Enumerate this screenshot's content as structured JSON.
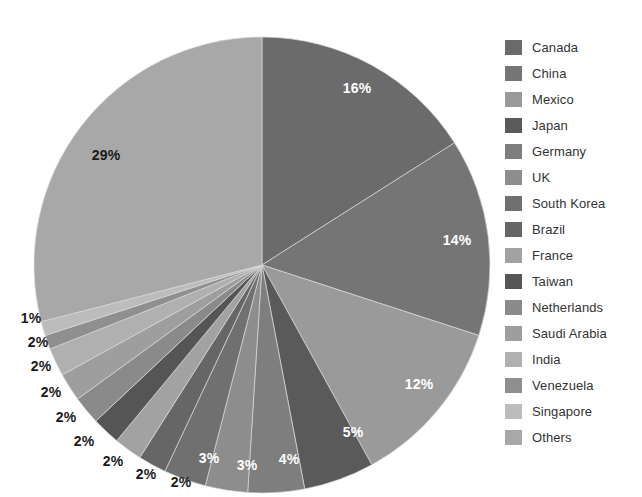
{
  "chart_data": {
    "type": "pie",
    "title": "",
    "subtitle": "",
    "xlabel": "",
    "ylabel": "",
    "grid": false,
    "legend_position": "right",
    "label_format": "percent",
    "start_angle_deg": 0,
    "direction": "clockwise",
    "categories": [
      "Canada",
      "China",
      "Mexico",
      "Japan",
      "Germany",
      "UK",
      "South Korea",
      "Brazil",
      "France",
      "Taiwan",
      "Netherlands",
      "Saudi Arabia",
      "India",
      "Venezuela",
      "Singapore",
      "Others"
    ],
    "values": [
      16,
      14,
      12,
      5,
      4,
      3,
      3,
      2,
      2,
      2,
      2,
      2,
      2,
      1,
      1,
      29
    ],
    "data_labels": [
      "16%",
      "14%",
      "12%",
      "5%",
      "4%",
      "3%",
      "3%",
      "2%",
      "2%",
      "2%",
      "2%",
      "2%",
      "2%",
      "1%",
      "1%",
      "29%"
    ],
    "colors": [
      "#6b6b6b",
      "#757575",
      "#9a9a9a",
      "#5a5a5a",
      "#7e7e7e",
      "#8d8d8d",
      "#707070",
      "#666666",
      "#a2a2a2",
      "#555555",
      "#8a8a8a",
      "#9e9e9e",
      "#b0b0b0",
      "#8f8f8f",
      "#bcbcbc",
      "#a8a8a8"
    ],
    "slice_label_positions": [
      {
        "label": "16%",
        "x": 357,
        "y": 88,
        "placement": "inside"
      },
      {
        "label": "14%",
        "x": 457,
        "y": 240,
        "placement": "inside"
      },
      {
        "label": "12%",
        "x": 419,
        "y": 384,
        "placement": "inside"
      },
      {
        "label": "5%",
        "x": 353,
        "y": 432,
        "placement": "inside"
      },
      {
        "label": "4%",
        "x": 289,
        "y": 459,
        "placement": "inside"
      },
      {
        "label": "3%",
        "x": 247,
        "y": 465,
        "placement": "inside"
      },
      {
        "label": "3%",
        "x": 209,
        "y": 458,
        "placement": "inside"
      },
      {
        "label": "2%",
        "x": 181,
        "y": 482,
        "placement": "outside"
      },
      {
        "label": "2%",
        "x": 146,
        "y": 474,
        "placement": "outside"
      },
      {
        "label": "2%",
        "x": 113,
        "y": 461,
        "placement": "outside"
      },
      {
        "label": "2%",
        "x": 84,
        "y": 441,
        "placement": "outside"
      },
      {
        "label": "2%",
        "x": 66,
        "y": 417,
        "placement": "outside"
      },
      {
        "label": "2%",
        "x": 51,
        "y": 392,
        "placement": "outside"
      },
      {
        "label": "2%",
        "x": 41,
        "y": 366,
        "placement": "outside"
      },
      {
        "label": "2%",
        "x": 38,
        "y": 342,
        "placement": "outside"
      },
      {
        "label": "1%",
        "x": 31,
        "y": 318,
        "placement": "outside"
      },
      {
        "label": "29%",
        "x": 106,
        "y": 155,
        "placement": "outside"
      }
    ],
    "geometry": {
      "center_x": 262,
      "center_y": 265,
      "radius": 228
    }
  },
  "legend": {
    "items": [
      {
        "label": "Canada",
        "color": "#6b6b6b"
      },
      {
        "label": "China",
        "color": "#757575"
      },
      {
        "label": "Mexico",
        "color": "#9a9a9a"
      },
      {
        "label": "Japan",
        "color": "#5a5a5a"
      },
      {
        "label": "Germany",
        "color": "#7e7e7e"
      },
      {
        "label": "UK",
        "color": "#8d8d8d"
      },
      {
        "label": "South Korea",
        "color": "#707070"
      },
      {
        "label": "Brazil",
        "color": "#666666"
      },
      {
        "label": "France",
        "color": "#a2a2a2"
      },
      {
        "label": "Taiwan",
        "color": "#555555"
      },
      {
        "label": "Netherlands",
        "color": "#8a8a8a"
      },
      {
        "label": "Saudi Arabia",
        "color": "#9e9e9e"
      },
      {
        "label": "India",
        "color": "#b0b0b0"
      },
      {
        "label": "Venezuela",
        "color": "#8f8f8f"
      },
      {
        "label": "Singapore",
        "color": "#bcbcbc"
      },
      {
        "label": "Others",
        "color": "#a8a8a8"
      }
    ]
  }
}
